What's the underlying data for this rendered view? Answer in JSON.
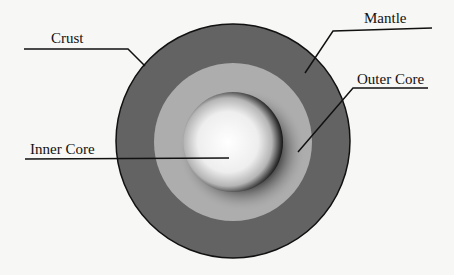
{
  "diagram": {
    "labels": {
      "crust": "Crust",
      "mantle": "Mantle",
      "outer_core": "Outer Core",
      "inner_core": "Inner Core"
    },
    "colors": {
      "background": "#f7f7f5",
      "mantle": "#636363",
      "outer_core_light": "#adadad",
      "inner_core_center": "#ffffff",
      "inner_core_edge": "#141414",
      "outline": "#111111"
    }
  }
}
